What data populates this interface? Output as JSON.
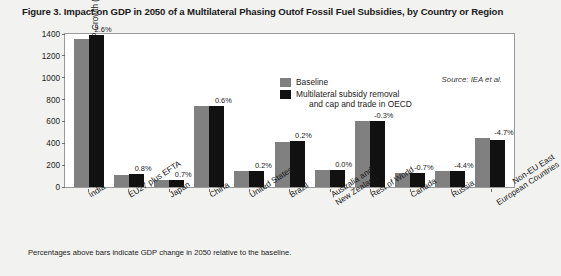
{
  "figure": {
    "title": "Figure 3. Impact on GDP in 2050 of a Multilateral Phasing Outof Fossil Fuel Subsidies, by Country or Region",
    "source": "Source: IEA et al.",
    "footnote": "Percentages above bars indicate GDP change in 2050 relative to the baseline.",
    "legend": {
      "baseline_label": "Baseline",
      "policy_label_line1": "Multilateral subsidy removal",
      "policy_label_line2": "and cap and trade in OECD"
    },
    "colors": {
      "baseline": "#808080",
      "policy": "#111111",
      "page_background": "#f2f2f0",
      "plot_background": "#ffffff",
      "axis": "#9a9a9a"
    }
  },
  "chart_data": {
    "type": "bar",
    "title": "Figure 3. Impact on GDP in 2050 of a Multilateral Phasing Outof Fossil Fuel Subsidies, by Country or Region",
    "xlabel": "",
    "ylabel": "Projected GDP Growth (%)",
    "ylim": [
      0,
      1400
    ],
    "yticks": [
      0,
      200,
      400,
      600,
      800,
      1000,
      1200,
      1400
    ],
    "ytick_labels": [
      "0",
      "200",
      "400",
      "600",
      "800",
      "1000",
      "1200",
      "1400"
    ],
    "grid": false,
    "legend_position": "inside-top-center",
    "categories": [
      "India",
      "EU27 plus EFTA",
      "Japan",
      "China",
      "United States",
      "Brazil",
      "Australia and\nNew Zealand",
      "Rest of World",
      "Canada",
      "Russia",
      "Non-EU East\nEuropean Countries"
    ],
    "series": [
      {
        "name": "Baseline",
        "color": "#808080",
        "values": [
          1355,
          110,
          60,
          740,
          145,
          415,
          155,
          600,
          125,
          150,
          450
        ]
      },
      {
        "name": "Multilateral subsidy removal and cap and trade in OECD",
        "color": "#111111",
        "values": [
          1390,
          115,
          65,
          745,
          150,
          420,
          155,
          605,
          124,
          143,
          430
        ]
      }
    ],
    "annotations": [
      "2.6%",
      "0.8%",
      "0.7%",
      "0.6%",
      "0.2%",
      "0.2%",
      "0.0%",
      "-0.3%",
      "-0.7%",
      "-4.4%",
      "-4.7%"
    ]
  }
}
